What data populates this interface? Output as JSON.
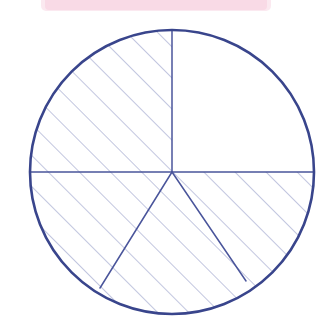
{
  "page": {
    "title": "Circle sector diagram with diagonal hatching",
    "background_color": "#ffffff",
    "width": 334,
    "height": 321
  },
  "figure": {
    "name": "hatched-circle-fractions",
    "description": "Hand-drawn style circle divided into five sectors by radii; four sectors are filled with 45 degree diagonal hatching, the upper-right quadrant is left blank.",
    "circle": {
      "center_x": 172,
      "center_y": 172,
      "radius": 142,
      "stroke_color": "#39458c",
      "stroke_width": 2.6,
      "fill_color": "#ffffff"
    },
    "radii": [
      {
        "name": "radius-up",
        "angle_degrees": 90,
        "end_x": 172,
        "end_y": 30,
        "stroke_color": "#4a559b",
        "stroke_width": 1.5
      },
      {
        "name": "radius-left",
        "angle_degrees": 180,
        "end_x": 30,
        "end_y": 172,
        "stroke_color": "#4a559b",
        "stroke_width": 1.5
      },
      {
        "name": "radius-right",
        "angle_degrees": 0,
        "end_x": 314,
        "end_y": 172,
        "stroke_color": "#4a559b",
        "stroke_width": 1.5
      },
      {
        "name": "radius-down-left",
        "angle_degrees": 239,
        "end_x": 100,
        "end_y": 288,
        "stroke_color": "#4a559b",
        "stroke_width": 1.5
      },
      {
        "name": "radius-down-right",
        "angle_degrees": 301,
        "end_x": 246,
        "end_y": 281,
        "stroke_color": "#4a559b",
        "stroke_width": 1.5
      }
    ],
    "hatching": {
      "angle_degrees": 45,
      "spacing_px": 22,
      "stroke_color": "#8f97c4",
      "stroke_width": 1.1
    },
    "sectors": [
      {
        "name": "sector-upper-left",
        "start_angle_degrees": 90,
        "end_angle_degrees": 180,
        "hatched": true,
        "label": "Upper left quadrant"
      },
      {
        "name": "sector-upper-right",
        "start_angle_degrees": 0,
        "end_angle_degrees": 90,
        "hatched": false,
        "label": "Upper right quadrant"
      },
      {
        "name": "sector-lower-left",
        "start_angle_degrees": 180,
        "end_angle_degrees": 239,
        "hatched": true,
        "label": "Lower left sector"
      },
      {
        "name": "sector-bottom-middle",
        "start_angle_degrees": 239,
        "end_angle_degrees": 301,
        "hatched": true,
        "label": "Bottom middle sector"
      },
      {
        "name": "sector-lower-right",
        "start_angle_degrees": 301,
        "end_angle_degrees": 360,
        "hatched": true,
        "label": "Lower right sector"
      }
    ]
  },
  "highlighter_mark": {
    "name": "pink-highlighter-stroke",
    "color": "#f7c3d6",
    "x": 45,
    "y": -6,
    "width": 222,
    "height": 16,
    "opacity": 0.85
  }
}
